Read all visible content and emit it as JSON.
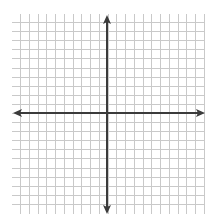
{
  "diagram": {
    "type": "coordinate-plane",
    "origin_px": [
      107,
      113
    ],
    "grid": {
      "x_start": 20,
      "x_end": 205,
      "x_spacing": 8.75,
      "vertical_line_count": 22,
      "y_start": 14,
      "y_end": 214,
      "y_spacing": 9.1,
      "line_color": "#c9c9c9",
      "line_width": 1
    },
    "axes": {
      "color": "#3b3b3b",
      "width": 2,
      "x_axis": {
        "y": 113,
        "x_from": 13,
        "x_to": 205
      },
      "y_axis": {
        "x": 107,
        "y_from": 15,
        "y_to": 214
      },
      "arrowheads": [
        "left",
        "right",
        "up",
        "down"
      ]
    },
    "labels": []
  }
}
